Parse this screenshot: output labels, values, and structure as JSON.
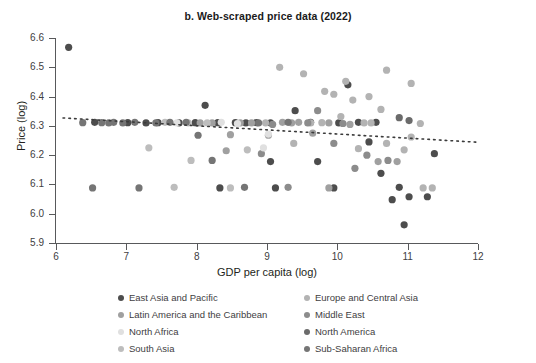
{
  "chart_data": {
    "type": "scatter",
    "title": "b. Web-scraped price data (2022)",
    "xlabel": "GDP per capita (log)",
    "ylabel": "Price (log)",
    "xlim": [
      6,
      12
    ],
    "ylim": [
      5.9,
      6.6
    ],
    "xticks": [
      "6",
      "7",
      "8",
      "9",
      "10",
      "11",
      "12"
    ],
    "yticks": [
      "6.6",
      "6.5",
      "6.4",
      "6.3",
      "6.2",
      "6.1",
      "6.0",
      "5.9"
    ],
    "grid": false,
    "legend_position": "below-axes",
    "trendline": {
      "style": "dotted",
      "color": "#3b3b3b",
      "x_start": 6.1,
      "y_start": 6.327,
      "x_end": 12.0,
      "y_end": 6.244
    },
    "series": [
      {
        "name": "East Asia and Pacific",
        "color": "#4d4d4d",
        "points": [
          [
            6.18,
            6.568
          ],
          [
            6.55,
            6.312
          ],
          [
            7.02,
            6.311
          ],
          [
            7.28,
            6.31
          ],
          [
            7.45,
            6.311
          ],
          [
            7.98,
            6.311
          ],
          [
            8.12,
            6.37
          ],
          [
            8.3,
            6.311
          ],
          [
            8.55,
            6.311
          ],
          [
            8.7,
            6.31
          ],
          [
            9.05,
            6.31
          ],
          [
            9.4,
            6.352
          ],
          [
            9.62,
            6.312
          ],
          [
            10.02,
            6.31
          ],
          [
            10.3,
            6.312
          ],
          [
            8.33,
            6.088
          ],
          [
            9.12,
            6.088
          ],
          [
            9.95,
            6.088
          ],
          [
            9.05,
            6.178
          ],
          [
            9.72,
            6.178
          ],
          [
            10.15,
            6.44
          ],
          [
            10.55,
            6.312
          ],
          [
            10.88,
            6.09
          ],
          [
            10.62,
            6.138
          ],
          [
            10.78,
            6.048
          ],
          [
            11.02,
            6.058
          ],
          [
            11.28,
            6.058
          ],
          [
            10.95,
            5.962
          ],
          [
            11.38,
            6.205
          ],
          [
            10.45,
            6.245
          ],
          [
            8.85,
            6.311
          ],
          [
            7.75,
            6.31
          ]
        ]
      },
      {
        "name": "Europe and Central Asia",
        "color": "#b3b3b3",
        "points": [
          [
            9.18,
            6.5
          ],
          [
            9.52,
            6.478
          ],
          [
            9.82,
            6.418
          ],
          [
            10.7,
            6.49
          ],
          [
            10.12,
            6.452
          ],
          [
            9.95,
            6.408
          ],
          [
            10.22,
            6.388
          ],
          [
            11.05,
            6.445
          ],
          [
            10.45,
            6.4
          ],
          [
            10.62,
            6.356
          ],
          [
            10.05,
            6.332
          ],
          [
            9.62,
            6.31
          ],
          [
            9.78,
            6.311
          ],
          [
            10.38,
            6.31
          ],
          [
            10.48,
            6.31
          ],
          [
            11.18,
            6.308
          ],
          [
            11.05,
            6.262
          ],
          [
            10.95,
            6.218
          ],
          [
            10.3,
            6.222
          ],
          [
            9.38,
            6.24
          ],
          [
            11.22,
            6.088
          ],
          [
            11.35,
            6.088
          ],
          [
            8.98,
            6.31
          ],
          [
            10.7,
            6.24
          ]
        ]
      },
      {
        "name": "Latin America and the Caribbean",
        "color": "#a0a0a0",
        "points": [
          [
            8.05,
            6.31
          ],
          [
            8.22,
            6.31
          ],
          [
            8.62,
            6.31
          ],
          [
            8.78,
            6.31
          ],
          [
            9.22,
            6.312
          ],
          [
            9.35,
            6.31
          ],
          [
            8.48,
            6.27
          ],
          [
            9.02,
            6.268
          ],
          [
            9.65,
            6.275
          ],
          [
            10.18,
            6.305
          ],
          [
            8.42,
            6.215
          ],
          [
            9.45,
            6.312
          ],
          [
            9.88,
            6.31
          ],
          [
            10.58,
            6.178
          ],
          [
            10.85,
            6.178
          ],
          [
            9.88,
            6.088
          ]
        ]
      },
      {
        "name": "Middle East",
        "color": "#8c8c8c",
        "points": [
          [
            9.08,
            6.305
          ],
          [
            9.58,
            6.31
          ],
          [
            9.72,
            6.352
          ],
          [
            10.08,
            6.308
          ],
          [
            9.3,
            6.09
          ],
          [
            8.92,
            6.205
          ],
          [
            10.42,
            6.2
          ],
          [
            10.72,
            6.182
          ],
          [
            9.95,
            6.24
          ],
          [
            10.25,
            6.155
          ]
        ]
      },
      {
        "name": "North Africa",
        "color": "#e0e0e0",
        "points": [
          [
            8.35,
            6.312
          ],
          [
            8.58,
            6.308
          ],
          [
            9.02,
            6.272
          ],
          [
            7.72,
            6.31
          ],
          [
            8.95,
            6.225
          ]
        ]
      },
      {
        "name": "North America",
        "color": "#6b6b6b",
        "points": [
          [
            10.88,
            6.328
          ],
          [
            11.02,
            6.318
          ]
        ]
      },
      {
        "name": "South Asia",
        "color": "#bdbdbd",
        "points": [
          [
            7.32,
            6.225
          ],
          [
            7.55,
            6.312
          ],
          [
            7.88,
            6.31
          ],
          [
            8.15,
            6.31
          ],
          [
            7.68,
            6.09
          ],
          [
            8.72,
            6.218
          ],
          [
            8.48,
            6.088
          ],
          [
            7.92,
            6.182
          ]
        ]
      },
      {
        "name": "Sub-Saharan Africa",
        "color": "#757575",
        "points": [
          [
            6.52,
            6.088
          ],
          [
            6.82,
            6.312
          ],
          [
            7.12,
            6.312
          ],
          [
            7.42,
            6.31
          ],
          [
            7.62,
            6.312
          ],
          [
            6.95,
            6.31
          ],
          [
            8.22,
            6.182
          ],
          [
            8.88,
            6.31
          ],
          [
            7.18,
            6.088
          ],
          [
            6.75,
            6.31
          ],
          [
            8.68,
            6.09
          ],
          [
            7.85,
            6.312
          ],
          [
            8.02,
            6.268
          ],
          [
            6.38,
            6.311
          ],
          [
            9.3,
            6.312
          ],
          [
            6.65,
            6.311
          ]
        ]
      }
    ]
  },
  "legend": {
    "left_column": [
      {
        "label": "East Asia and Pacific",
        "color": "#4d4d4d"
      },
      {
        "label": "Latin America and the Caribbean",
        "color": "#a0a0a0"
      },
      {
        "label": "North Africa",
        "color": "#e0e0e0"
      },
      {
        "label": "South Asia",
        "color": "#bdbdbd"
      }
    ],
    "right_column": [
      {
        "label": "Europe and Central Asia",
        "color": "#b3b3b3"
      },
      {
        "label": "Middle East",
        "color": "#8c8c8c"
      },
      {
        "label": "North America",
        "color": "#6b6b6b"
      },
      {
        "label": "Sub-Saharan Africa",
        "color": "#757575"
      }
    ]
  }
}
